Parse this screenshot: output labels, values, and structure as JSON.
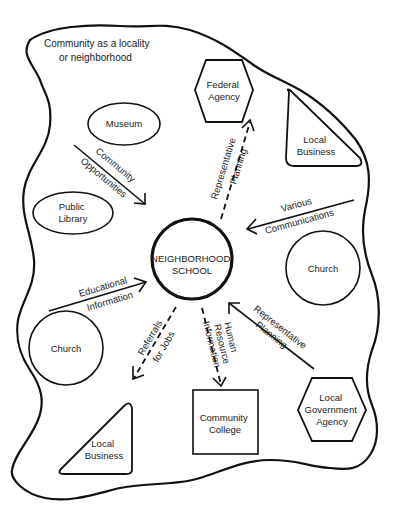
{
  "diagram": {
    "title": "Community as a locality or neighborhood",
    "title_lines": [
      "Community as a locality",
      "or neighborhood"
    ],
    "center": {
      "label_lines": [
        "NEIGHBORHOOD",
        "SCHOOL"
      ],
      "shape": "circle"
    },
    "nodes": [
      {
        "id": "museum",
        "label_lines": [
          "Museum"
        ],
        "shape": "ellipse"
      },
      {
        "id": "public-library",
        "label_lines": [
          "Public",
          "Library"
        ],
        "shape": "ellipse"
      },
      {
        "id": "federal-agency",
        "label_lines": [
          "Federal",
          "Agency"
        ],
        "shape": "hexagon"
      },
      {
        "id": "local-business-top",
        "label_lines": [
          "Local",
          "Business"
        ],
        "shape": "triangle"
      },
      {
        "id": "church-right",
        "label_lines": [
          "Church"
        ],
        "shape": "circle"
      },
      {
        "id": "church-left",
        "label_lines": [
          "Church"
        ],
        "shape": "circle"
      },
      {
        "id": "local-government-agency",
        "label_lines": [
          "Local",
          "Government",
          "Agency"
        ],
        "shape": "hexagon"
      },
      {
        "id": "community-college",
        "label_lines": [
          "Community",
          "College"
        ],
        "shape": "square"
      },
      {
        "id": "local-business-bottom",
        "label_lines": [
          "Local",
          "Business"
        ],
        "shape": "triangle"
      }
    ],
    "edges": [
      {
        "from": "museum-area",
        "to": "school",
        "label_lines": [
          "Community",
          "Opportunities"
        ],
        "style": "solid"
      },
      {
        "from": "school",
        "to": "federal-agency",
        "label_lines": [
          "Representative",
          "Planning"
        ],
        "style": "dashed"
      },
      {
        "from": "church-right-area",
        "to": "school",
        "label_lines": [
          "Various",
          "Communications"
        ],
        "style": "solid"
      },
      {
        "from": "church-left",
        "to": "school",
        "label_lines": [
          "Educational",
          "Information"
        ],
        "style": "solid"
      },
      {
        "from": "school",
        "to": "local-business-bottom",
        "label_lines": [
          "Referrals",
          "for Jobs"
        ],
        "style": "dashed"
      },
      {
        "from": "school",
        "to": "community-college",
        "label_lines": [
          "Human",
          "Resource",
          "Information"
        ],
        "style": "dashed"
      },
      {
        "from": "local-government-agency",
        "to": "school",
        "label_lines": [
          "Representative",
          "Planning"
        ],
        "style": "solid"
      }
    ]
  }
}
